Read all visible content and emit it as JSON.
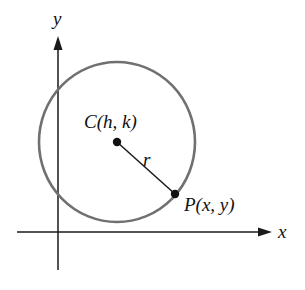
{
  "diagram": {
    "type": "circle-definition",
    "axes": {
      "x_label": "x",
      "y_label": "y",
      "color": "#1a1a1a"
    },
    "circle": {
      "stroke_color": "#707070"
    },
    "center": {
      "label": "C(h, k)"
    },
    "point": {
      "label": "P(x, y)"
    },
    "radius": {
      "label": "r"
    }
  }
}
